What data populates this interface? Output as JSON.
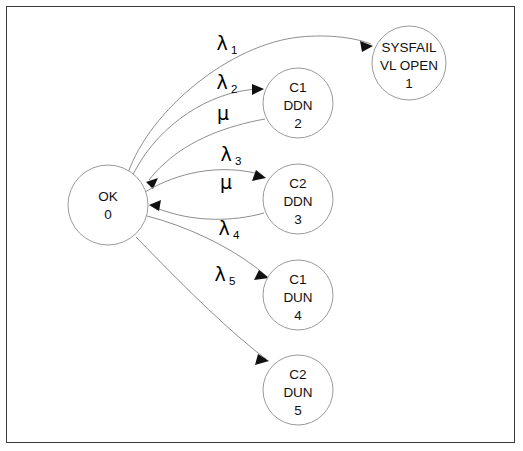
{
  "figure": {
    "type": "state-transition-diagram",
    "title": "",
    "border_color": "#3a3a3a",
    "background": "#ffffff",
    "node_stroke": "#9a9a9a",
    "edge_stroke": "#8e8e8e",
    "arrow_color": "#111111"
  },
  "nodes": [
    {
      "id": "ok",
      "lines": [
        "OK",
        "0"
      ],
      "line1": "OK",
      "line2": "0",
      "line3": "",
      "state_number": "0",
      "cx": 108,
      "cy": 205,
      "r": 40
    },
    {
      "id": "sysfail",
      "lines": [
        "SYSFAIL",
        "VL OPEN",
        "1"
      ],
      "line1": "SYSFAIL",
      "line2": "VL OPEN",
      "line3": "1",
      "state_number": "1",
      "cx": 409,
      "cy": 63,
      "r": 37
    },
    {
      "id": "c1ddn",
      "lines": [
        "C1",
        "DDN",
        "2"
      ],
      "line1": "C1",
      "line2": "DDN",
      "line3": "2",
      "state_number": "2",
      "cx": 298,
      "cy": 103,
      "r": 35
    },
    {
      "id": "c2ddn",
      "lines": [
        "C2",
        "DDN",
        "3"
      ],
      "line1": "C2",
      "line2": "DDN",
      "line3": "3",
      "state_number": "3",
      "cx": 298,
      "cy": 199,
      "r": 35
    },
    {
      "id": "c1dun",
      "lines": [
        "C1",
        "DUN",
        "4"
      ],
      "line1": "C1",
      "line2": "DUN",
      "line3": "4",
      "state_number": "4",
      "cx": 298,
      "cy": 295,
      "r": 35
    },
    {
      "id": "c2dun",
      "lines": [
        "C2",
        "DUN",
        "5"
      ],
      "line1": "C2",
      "line2": "DUN",
      "line3": "5",
      "state_number": "5",
      "cx": 298,
      "cy": 390,
      "r": 35
    }
  ],
  "edges": [
    {
      "id": "e-lambda1",
      "from": "ok",
      "to": "sysfail",
      "symbol": "λ",
      "subscript": "1",
      "label": "λ1",
      "label_x": 222,
      "label_y": 50
    },
    {
      "id": "e-lambda2",
      "from": "ok",
      "to": "c1ddn",
      "symbol": "λ",
      "subscript": "2",
      "label": "λ2",
      "label_x": 222,
      "label_y": 89
    },
    {
      "id": "e-mu-2",
      "from": "c1ddn",
      "to": "ok",
      "symbol": "μ",
      "subscript": "",
      "label": "μ",
      "label_x": 223,
      "label_y": 120
    },
    {
      "id": "e-lambda3",
      "from": "ok",
      "to": "c2ddn",
      "symbol": "λ",
      "subscript": "3",
      "label": "λ3",
      "label_x": 226,
      "label_y": 161
    },
    {
      "id": "e-mu-3",
      "from": "c2ddn",
      "to": "ok",
      "symbol": "μ",
      "subscript": "",
      "label": "μ",
      "label_x": 226,
      "label_y": 189
    },
    {
      "id": "e-lambda4",
      "from": "ok",
      "to": "c1dun",
      "symbol": "λ",
      "subscript": "4",
      "label": "λ4",
      "label_x": 224,
      "label_y": 235
    },
    {
      "id": "e-lambda5",
      "from": "ok",
      "to": "c2dun",
      "symbol": "λ",
      "subscript": "5",
      "label": "λ5",
      "label_x": 220,
      "label_y": 281
    }
  ]
}
